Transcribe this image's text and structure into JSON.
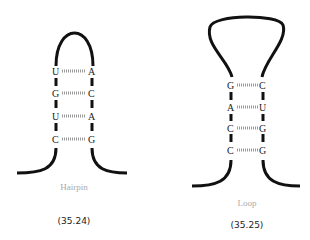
{
  "diagrams": [
    {
      "name": "Hairpin",
      "number": "(35.24)",
      "pairs": [
        {
          "left": "U",
          "right": "A"
        },
        {
          "left": "G",
          "right": "C"
        },
        {
          "left": "U",
          "right": "A"
        },
        {
          "left": "C",
          "right": "G"
        }
      ]
    },
    {
      "name": "Loop",
      "number": "(35.25)",
      "pairs": [
        {
          "left": "G",
          "right": "C"
        },
        {
          "left": "A",
          "right": "U"
        },
        {
          "left": "C",
          "right": "G"
        },
        {
          "left": "C",
          "right": "G"
        }
      ]
    }
  ]
}
